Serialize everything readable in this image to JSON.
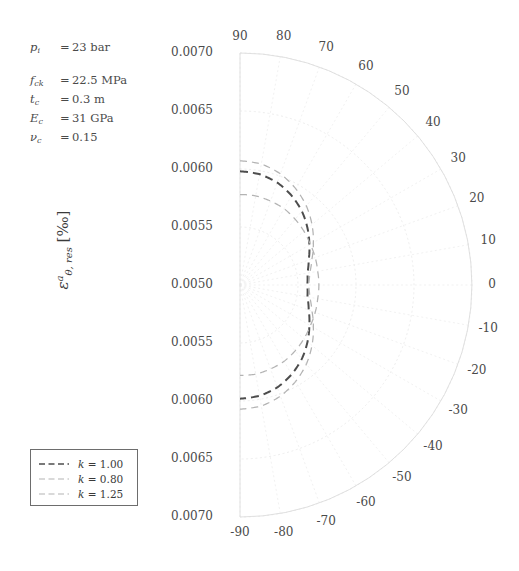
{
  "figure": {
    "ylabel_eps": "ε",
    "ylabel_sup": "a",
    "ylabel_sub": "θ, res",
    "ylabel_unit": "[‰]"
  },
  "parameters": [
    {
      "symbol": "p",
      "sub": "i",
      "eq": "=",
      "value": "23 bar"
    },
    {
      "symbol": "f",
      "sub": "ck",
      "eq": "=",
      "value": "22.5 MPa"
    },
    {
      "symbol": "t",
      "sub": "c",
      "eq": "=",
      "value": "0.3 m"
    },
    {
      "symbol": "E",
      "sub": "c",
      "eq": "=",
      "value": "31 GPa"
    },
    {
      "symbol": "ν",
      "sub": "c",
      "eq": "=",
      "value": "0.15"
    }
  ],
  "legend": {
    "items": [
      {
        "label_sym": "k",
        "label_eq": " = ",
        "label_val": "1.00",
        "color": "#4d4d4d",
        "dash": "7,4",
        "width": 1.8
      },
      {
        "label_sym": "k",
        "label_eq": " = ",
        "label_val": "0.80",
        "color": "#b3b3b3",
        "dash": "7,4",
        "width": 1.1
      },
      {
        "label_sym": "k",
        "label_eq": " = ",
        "label_val": "1.25",
        "color": "#b3b3b3",
        "dash": "7,4",
        "width": 1.1
      }
    ]
  },
  "chart_data": {
    "type": "line",
    "projection": "polar",
    "title": "",
    "xlabel": "",
    "ylabel": "ε^a_θ,res [‰]",
    "theta_unit": "degrees",
    "theta_ticks": [
      90,
      80,
      70,
      60,
      50,
      40,
      30,
      20,
      10,
      0,
      -10,
      -20,
      -30,
      -40,
      -50,
      -60,
      -70,
      -80,
      -90
    ],
    "theta_tick_labels": [
      "90",
      "80",
      "70",
      "60",
      "50",
      "40",
      "30",
      "20",
      "10",
      "0",
      "-10",
      "-20",
      "-30",
      "-40",
      "-50",
      "-60",
      "-70",
      "-80",
      "-90"
    ],
    "r_ticks": [
      0.005,
      0.0055,
      0.006,
      0.0065,
      0.007
    ],
    "r_tick_labels_top": [
      "0.0070",
      "0.0065",
      "0.0060",
      "0.0055",
      "0.0050"
    ],
    "r_tick_labels_bottom": [
      "0.0055",
      "0.0060",
      "0.0065",
      "0.0070"
    ],
    "rlim": [
      0.005,
      0.007
    ],
    "grid": true,
    "legend_position": "lower-left",
    "series": [
      {
        "name": "k = 1.00",
        "color": "#4d4d4d",
        "linestyle": "dashed",
        "theta": [
          90,
          80,
          70,
          60,
          50,
          40,
          30,
          20,
          10,
          0,
          -10,
          -20,
          -30,
          -40,
          -50,
          -60,
          -70,
          -80,
          -90
        ],
        "r": [
          0.00598,
          0.00597,
          0.00594,
          0.00589,
          0.00583,
          0.00576,
          0.00569,
          0.00563,
          0.00559,
          0.00558,
          0.00559,
          0.00563,
          0.00569,
          0.00576,
          0.00583,
          0.00589,
          0.00594,
          0.00597,
          0.00598
        ]
      },
      {
        "name": "k = 0.80",
        "color": "#b3b3b3",
        "linestyle": "dashed",
        "theta": [
          90,
          80,
          70,
          60,
          50,
          40,
          30,
          20,
          10,
          0,
          -10,
          -20,
          -30,
          -40,
          -50,
          -60,
          -70,
          -80,
          -90
        ],
        "r": [
          0.00578,
          0.00578,
          0.00577,
          0.00576,
          0.00574,
          0.00572,
          0.0057,
          0.00569,
          0.00568,
          0.00568,
          0.00568,
          0.00569,
          0.0057,
          0.00572,
          0.00574,
          0.00576,
          0.00577,
          0.00578,
          0.00578
        ]
      },
      {
        "name": "k = 1.25",
        "color": "#b3b3b3",
        "linestyle": "dashed",
        "theta": [
          90,
          80,
          70,
          60,
          50,
          40,
          30,
          20,
          10,
          0,
          -10,
          -20,
          -30,
          -40,
          -50,
          -60,
          -70,
          -80,
          -90
        ],
        "r": [
          0.00607,
          0.00606,
          0.00602,
          0.00596,
          0.00589,
          0.00581,
          0.00573,
          0.00566,
          0.00561,
          0.00559,
          0.00561,
          0.00566,
          0.00573,
          0.00581,
          0.00589,
          0.00596,
          0.00602,
          0.00606,
          0.00607
        ]
      }
    ],
    "annotations": {
      "p_i": "23 bar",
      "f_ck": "22.5 MPa",
      "t_c": "0.3 m",
      "E_c": "31 GPa",
      "nu_c": "0.15"
    }
  }
}
